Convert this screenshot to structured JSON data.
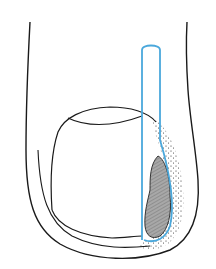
{
  "figure": {
    "colors": {
      "background": "#ffffff",
      "outline": "#1a1a1a",
      "probe": "#4aa8dc",
      "lesion_fill": "#a8a8a8",
      "lesion_hatch": "#555555",
      "stipple": "#222222"
    },
    "elements": [
      "finger-outline",
      "nail-plate",
      "probe",
      "lesion",
      "stippled-nail-fold"
    ]
  }
}
